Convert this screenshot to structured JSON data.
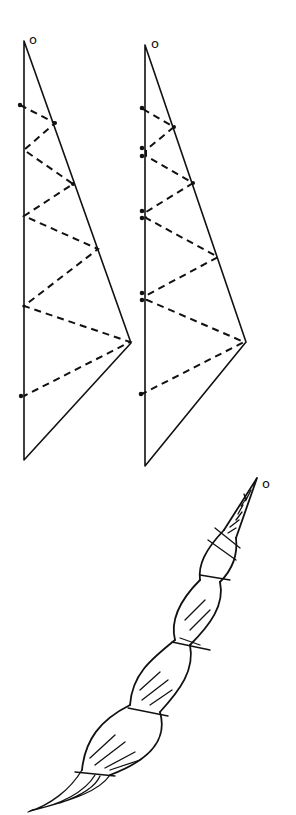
{
  "diagram": {
    "type": "hand-drawn folding/twisting diagram",
    "panels": [
      {
        "id": "left-triangle",
        "apex_label": "o",
        "description": "Tall right triangle with dashed zigzag fold lines between vertical edge and hypotenuse; single dots on vertical edge"
      },
      {
        "id": "right-triangle",
        "apex_label": "o",
        "description": "Same triangle with dashed zigzag fold lines; paired dots on vertical edge at fold points"
      },
      {
        "id": "twisted-strip",
        "apex_label": "o",
        "description": "Triangle rolled into a twisted spiral cone with wrapped bands, hatching, and frayed lower tip"
      }
    ],
    "colors": {
      "ink": "#111111",
      "background": "#ffffff"
    }
  }
}
